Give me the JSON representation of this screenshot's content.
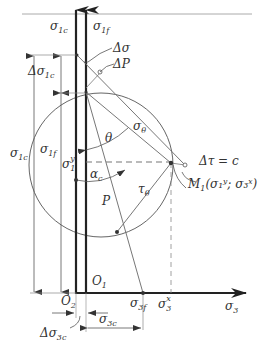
{
  "diagram": {
    "colors": {
      "line": "#555555",
      "axis": "#222222",
      "thin": "#888888",
      "dash": "#777777",
      "top_rule": "#aaaaaa"
    },
    "labels": {
      "sigma_1c_axis": {
        "base": "σ",
        "sub": "1c"
      },
      "sigma_1f_axis": {
        "base": "σ",
        "sub": "1f"
      },
      "delta_sigma": "Δσ",
      "delta_P": "ΔP",
      "delta_sigma_1c": {
        "base": "Δσ",
        "sub": "1c"
      },
      "sigma_1c_dim": {
        "base": "σ",
        "sub": "1c"
      },
      "sigma_1f_dim": {
        "base": "σ",
        "sub": "1f"
      },
      "sigma_1_y": {
        "base": "σ",
        "sub": "1",
        "sup": "y"
      },
      "theta": "θ",
      "sigma_theta": {
        "base": "σ",
        "sub": "θ"
      },
      "alpha_c": {
        "base": "α",
        "sub": "c"
      },
      "tau_theta": {
        "base": "τ",
        "sub": "θ"
      },
      "P": "P",
      "delta_tau_eq_c": "Δτ = c",
      "M1": {
        "base": "M",
        "sub": "1",
        "args": "(σ₁ʸ; σ₃ˣ)"
      },
      "O1": {
        "base": "O",
        "sub": "1"
      },
      "O2": {
        "base": "O",
        "sub": "2"
      },
      "sigma_3f": {
        "base": "σ",
        "sub": "3f"
      },
      "sigma_3_x": {
        "base": "σ",
        "sub": "3",
        "sup": "x"
      },
      "sigma_3_axis": {
        "base": "σ",
        "sub": "3"
      },
      "delta_sigma_3c": {
        "base": "Δσ",
        "sub": "3c"
      },
      "sigma_3c": {
        "base": "σ",
        "sub": "3c"
      }
    }
  }
}
